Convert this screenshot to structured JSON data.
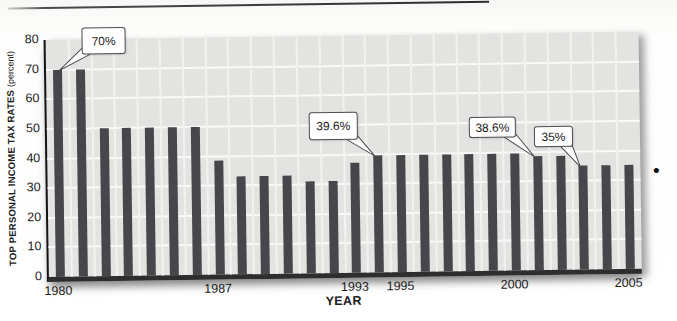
{
  "page": {
    "bullet_glyph": "•"
  },
  "chart_data": {
    "type": "bar",
    "title": "",
    "xlabel": "YEAR",
    "ylabel": "TOP PERSONAL INCOME TAX RATES",
    "ylabel_suffix": "(percent)",
    "ylim": [
      0,
      80
    ],
    "yticks": [
      0,
      10,
      20,
      30,
      40,
      50,
      60,
      70,
      80
    ],
    "grid": "white gridlines on light-gray plot, horizontal every 10, vertical every year",
    "legend": "none",
    "categories": [
      1980,
      1981,
      1982,
      1983,
      1984,
      1985,
      1986,
      1987,
      1988,
      1989,
      1990,
      1991,
      1992,
      1993,
      1994,
      1995,
      1996,
      1997,
      1998,
      1999,
      2000,
      2001,
      2002,
      2003,
      2004,
      2005
    ],
    "values": [
      70,
      70,
      50,
      50,
      50,
      50,
      50,
      38.5,
      33,
      33,
      33,
      31,
      31,
      37,
      39.6,
      39.6,
      39.6,
      39.6,
      39.6,
      39.6,
      39.6,
      38.6,
      38.6,
      35,
      35,
      35
    ],
    "x_ticks": [
      {
        "year": 1980,
        "label": "1980"
      },
      {
        "year": 1987,
        "label": "1987"
      },
      {
        "year": 1993,
        "label": "1993"
      },
      {
        "year": 1995,
        "label": "1995"
      },
      {
        "year": 2000,
        "label": "2000"
      },
      {
        "year": 2005,
        "label": "2005"
      }
    ],
    "annotations": [
      {
        "label": "70%",
        "target_year": 1980,
        "box": {
          "x": 36,
          "y": -12,
          "w": 42,
          "h": 25
        }
      },
      {
        "label": "39.6%",
        "target_year": 1994,
        "box": {
          "x": 262,
          "y": 76,
          "w": 47,
          "h": 26
        }
      },
      {
        "label": "38.6%",
        "target_year": 2001,
        "box": {
          "x": 422,
          "y": 83,
          "w": 45,
          "h": 19
        }
      },
      {
        "label": "35%",
        "target_year": 2003,
        "box": {
          "x": 487,
          "y": 93,
          "w": 37,
          "h": 19
        }
      }
    ],
    "colors": {
      "bar": "#46464b",
      "plot_bg": "#e3e3e1",
      "gridline": "#f9f9f7",
      "axis": "#141414",
      "baseline": "#2e2e2e",
      "callout_bg": "#ffffff",
      "callout_border": "#4e4e4e"
    }
  }
}
